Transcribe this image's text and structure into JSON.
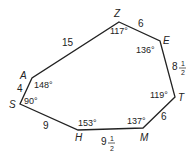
{
  "diagram": {
    "type": "heptagon",
    "stroke_color": "#222222",
    "vertices": [
      {
        "name": "Z",
        "angle": "117°"
      },
      {
        "name": "E",
        "angle": "136°"
      },
      {
        "name": "T",
        "angle": "119°"
      },
      {
        "name": "M",
        "angle": "137°"
      },
      {
        "name": "H",
        "angle": "153°"
      },
      {
        "name": "S",
        "angle": "90°"
      },
      {
        "name": "A",
        "angle": "148°"
      }
    ],
    "sides": [
      {
        "from": "Z",
        "to": "E",
        "length": "6"
      },
      {
        "from": "E",
        "to": "T",
        "whole": "8",
        "num": "1",
        "den": "2"
      },
      {
        "from": "T",
        "to": "M",
        "length": "6"
      },
      {
        "from": "M",
        "to": "H",
        "whole": "9",
        "num": "1",
        "den": "2"
      },
      {
        "from": "H",
        "to": "S",
        "length": "9"
      },
      {
        "from": "S",
        "to": "A",
        "length": "4"
      },
      {
        "from": "A",
        "to": "Z",
        "length": "15"
      }
    ]
  }
}
